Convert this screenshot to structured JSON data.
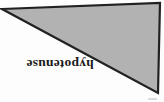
{
  "figure": {
    "label": "hypotenuse",
    "label_rotation_deg": "180",
    "label_color": "#1a1a1a",
    "triangle": {
      "points": "2,9 160,3 158,93",
      "fill": "#b2b2b2",
      "stroke": "#212121",
      "stroke_width": "2.2"
    },
    "background": "#fdfdfd"
  }
}
